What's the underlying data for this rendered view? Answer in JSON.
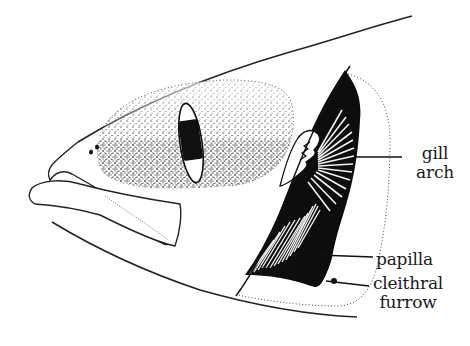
{
  "figure": {
    "colors": {
      "ink": "#111111",
      "background": "#ffffff"
    },
    "labels": {
      "gill_arch": {
        "line1": "gill",
        "line2": "arch"
      },
      "papilla": "papilla",
      "cleithral_furrow": {
        "line1": "cleithral",
        "line2": "furrow"
      }
    },
    "structures": [
      "dorsal-outline",
      "ventral-outline",
      "snout",
      "nostrils",
      "eye",
      "cheek-stippling",
      "upper-jaw",
      "lower-jaw",
      "operculum-gill-chamber",
      "gill-arch",
      "gill-filaments",
      "papilla",
      "cleithral-furrow"
    ]
  }
}
